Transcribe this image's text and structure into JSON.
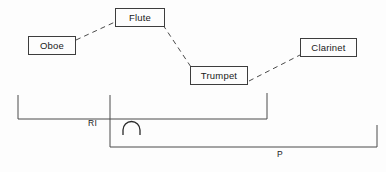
{
  "diagram": {
    "background_color": "#fdfdfd",
    "stroke_color": "#3d3d3d",
    "text_color": "#1a1a1a",
    "nodes": [
      {
        "id": "oboe",
        "label": "Oboe",
        "x": 28,
        "y": 36,
        "w": 48,
        "h": 19
      },
      {
        "id": "flute",
        "label": "Flute",
        "x": 115,
        "y": 8,
        "w": 50,
        "h": 19
      },
      {
        "id": "trumpet",
        "label": "Trumpet",
        "x": 190,
        "y": 66,
        "w": 58,
        "h": 19
      },
      {
        "id": "clarinet",
        "label": "Clarinet",
        "x": 300,
        "y": 38,
        "w": 57,
        "h": 19
      }
    ],
    "connectors": [
      {
        "id": "oboe-flute",
        "from": "oboe",
        "to": "flute",
        "style": "dashed"
      },
      {
        "id": "flute-trumpet",
        "from": "flute",
        "to": "trumpet",
        "style": "dashed"
      },
      {
        "id": "trumpet-clarinet",
        "from": "trumpet",
        "to": "clarinet",
        "style": "dashed"
      }
    ],
    "brackets": [
      {
        "id": "ri",
        "label": "RI",
        "left_x": 18,
        "right_x": 267,
        "top_y": 95,
        "bottom_y": 120,
        "label_x": 88,
        "label_y": 126
      },
      {
        "id": "p",
        "label": "P",
        "left_x": 110,
        "right_x": 377,
        "top_y": 125,
        "bottom_y": 148,
        "label_x": 277,
        "label_y": 152
      }
    ],
    "symbols": [
      {
        "id": "intersection-arc",
        "glyph": "arc",
        "x": 122,
        "y": 123,
        "w": 20,
        "h": 12
      }
    ]
  }
}
